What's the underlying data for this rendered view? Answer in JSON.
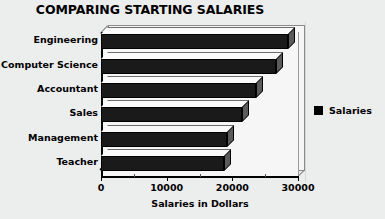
{
  "chart_data": {
    "type": "bar",
    "orientation": "horizontal",
    "title": "COMPARING STARTING SALARIES",
    "xlabel": "Salaries in Dollars",
    "ylabel": "",
    "categories": [
      "Engineering",
      "Computer Science",
      "Accountant",
      "Sales",
      "Management",
      "Teacher"
    ],
    "values": [
      28500,
      26700,
      23600,
      21400,
      19200,
      18800
    ],
    "series": [
      {
        "name": "Salaries",
        "values": [
          28500,
          26700,
          23600,
          21400,
          19200,
          18800
        ]
      }
    ],
    "xlim": [
      0,
      30000
    ],
    "xticks": [
      0,
      10000,
      20000,
      30000
    ],
    "xtick_labels": [
      "0",
      "10000",
      "20000",
      "30000"
    ],
    "minor_xticks": [
      5000,
      15000,
      25000
    ],
    "grid": false,
    "legend": {
      "position": "right",
      "entries": [
        {
          "label": "Salaries",
          "color": "#000000"
        }
      ]
    },
    "style": {
      "three_d": true,
      "bar_color": "#1a1a1a",
      "background": "#eceded",
      "plot_background": "#f6f6f6"
    }
  },
  "legend": {
    "swatch_name": "legend-color-swatch",
    "label": "Salaries"
  }
}
